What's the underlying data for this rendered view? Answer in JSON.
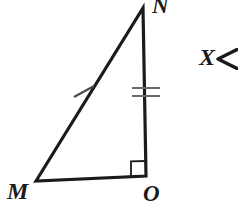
{
  "figure": {
    "background_color": "#ffffff",
    "stroke_color": "#1b1b1b",
    "tick_color": "#555555",
    "labels": {
      "vertex_n": "N",
      "vertex_m": "M",
      "vertex_o": "O"
    },
    "annotation": {
      "text": "X",
      "arrow_icon": "left-arrowhead-icon"
    },
    "geometry": {
      "vertex_n": [
        143,
        8
      ],
      "vertex_m": [
        36,
        181
      ],
      "vertex_o": [
        146,
        176
      ],
      "sides": [
        {
          "name": "MN",
          "from": "M",
          "to": "N",
          "tick_count": 1
        },
        {
          "name": "NO",
          "from": "N",
          "to": "O",
          "tick_count": 2
        },
        {
          "name": "MO",
          "from": "M",
          "to": "O",
          "tick_count": 0
        }
      ],
      "right_angle_at": "O",
      "right_angle_marker_size": 15
    }
  }
}
